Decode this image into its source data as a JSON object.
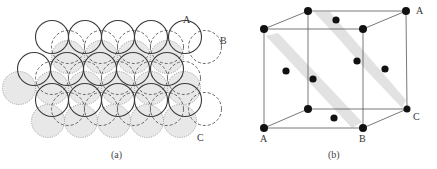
{
  "figure": {
    "panel_a": {
      "caption": "(a)",
      "layer_labels": {
        "a": "A",
        "b": "B",
        "c": "C"
      },
      "layers": [
        {
          "name": "A",
          "style": "solid",
          "color": "#3a3a3a"
        },
        {
          "name": "B",
          "style": "dashed",
          "color": "#555555"
        },
        {
          "name": "C",
          "style": "dotted-filled",
          "color": "#888888",
          "fill": "#e3e3e3"
        }
      ]
    },
    "panel_b": {
      "caption": "(b)",
      "vertex_labels": {
        "top_right": "A",
        "bottom_left": "A",
        "bottom_front_right": "B",
        "bottom_back_right": "C"
      },
      "atom_color": "#111111",
      "plane_color": "#e0e0e0",
      "edge_color": "#555555"
    }
  }
}
